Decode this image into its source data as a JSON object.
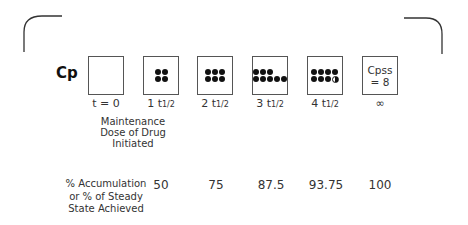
{
  "diagram": {
    "y_label": "Cp",
    "stages": [
      {
        "time": "t = 0",
        "dots": 0,
        "half_dot": false,
        "percent": ""
      },
      {
        "time": "1 t1/2",
        "dots": 4,
        "half_dot": false,
        "percent": "50"
      },
      {
        "time": "2 t1/2",
        "dots": 6,
        "half_dot": false,
        "percent": "75"
      },
      {
        "time": "3 t1/2",
        "dots": 7,
        "half_dot": false,
        "percent": "87.5"
      },
      {
        "time": "4 t1/2",
        "dots": 7,
        "half_dot": true,
        "percent": "93.75"
      },
      {
        "time": "∞",
        "box_text_line1": "Cpss",
        "box_text_line2": "= 8",
        "percent": "100"
      }
    ],
    "maintenance_note": {
      "line1": "Maintenance",
      "line2": "Dose of Drug",
      "line3": "Initiated"
    },
    "accumulation_label": {
      "line1": "% Accumulation",
      "line2": "or % of Steady",
      "line3": "State Achieved"
    },
    "tick_labels": {
      "t0": "t = 0",
      "t1": "1 t",
      "t2": "2 t",
      "t3": "3 t",
      "t4": "4 t",
      "half": "1/2",
      "inf": "∞"
    },
    "box6": {
      "line1": "Cpss",
      "line2": "= 8"
    },
    "percents": {
      "p1": "50",
      "p2": "75",
      "p3": "87.5",
      "p4": "93.75",
      "p5": "100"
    }
  }
}
